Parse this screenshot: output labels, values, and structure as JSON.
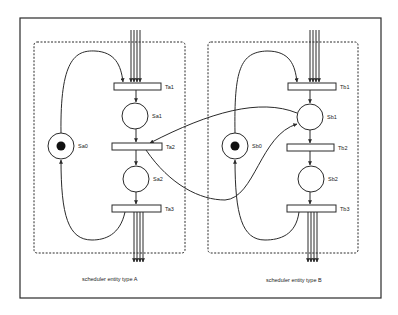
{
  "diagram": {
    "type": "petri-net",
    "colors": {
      "stroke": "#2a2a2a",
      "background": "#ffffff",
      "token": "#111111"
    },
    "entities": [
      {
        "id": "A",
        "caption": "scheduler entity type A",
        "box": {
          "x": 34,
          "y": 42,
          "w": 151,
          "h": 211
        },
        "places": [
          {
            "id": "Sa0",
            "label": "Sa0",
            "cx": 61,
            "cy": 146,
            "r": 13,
            "token": true
          },
          {
            "id": "Sa1",
            "label": "Sa1",
            "cx": 135,
            "cy": 116,
            "r": 13,
            "token": false
          },
          {
            "id": "Sa2",
            "label": "Sa2",
            "cx": 136,
            "cy": 179,
            "r": 13,
            "token": false
          }
        ],
        "transitions": [
          {
            "id": "Ta1",
            "label": "Ta1",
            "x": 114,
            "y": 83,
            "w": 47,
            "h": 7
          },
          {
            "id": "Ta2",
            "label": "Ta2",
            "x": 112,
            "y": 143,
            "w": 50,
            "h": 7
          },
          {
            "id": "Ta3",
            "label": "Ta3",
            "x": 112,
            "y": 205,
            "w": 49,
            "h": 7
          }
        ]
      },
      {
        "id": "B",
        "caption": "scheduler entity type B",
        "box": {
          "x": 208,
          "y": 42,
          "w": 150,
          "h": 211
        },
        "places": [
          {
            "id": "Sb0",
            "label": "Sb0",
            "cx": 235,
            "cy": 146,
            "r": 13,
            "token": true
          },
          {
            "id": "Sb1",
            "label": "Sb1",
            "cx": 310,
            "cy": 117,
            "r": 13,
            "token": false
          },
          {
            "id": "Sb2",
            "label": "Sb2",
            "cx": 311,
            "cy": 179,
            "r": 13,
            "token": false
          }
        ],
        "transitions": [
          {
            "id": "Tb1",
            "label": "Tb1",
            "x": 288,
            "y": 83,
            "w": 48,
            "h": 7
          },
          {
            "id": "Tb2",
            "label": "Tb2",
            "x": 287,
            "y": 144,
            "w": 47,
            "h": 7
          },
          {
            "id": "Tb3",
            "label": "Tb3",
            "x": 287,
            "y": 205,
            "w": 49,
            "h": 7
          }
        ]
      }
    ],
    "frame": {
      "x": 20,
      "y": 18,
      "w": 361,
      "h": 280
    }
  }
}
